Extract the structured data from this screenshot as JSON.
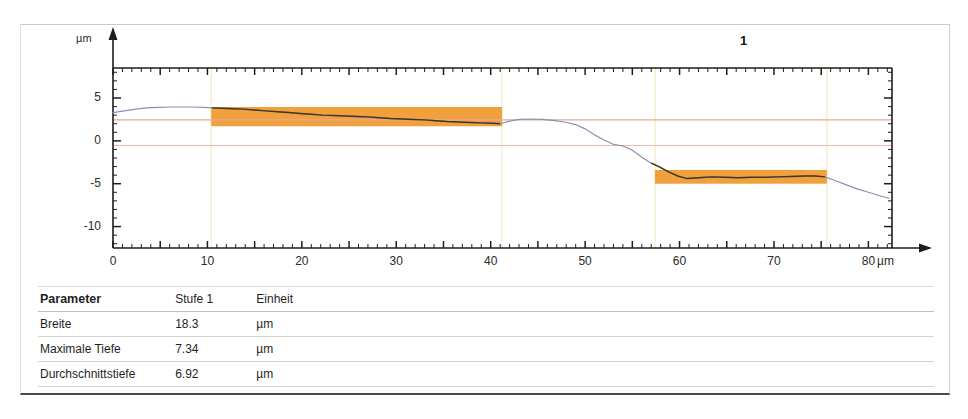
{
  "chart_data": {
    "type": "line",
    "title": "",
    "profile_label": "1",
    "xlabel": "",
    "ylabel": "",
    "x_unit": "µm",
    "y_unit": "µm",
    "xlim": [
      0,
      82.5
    ],
    "ylim": [
      -12.5,
      8.5
    ],
    "x_ticks": [
      0,
      10,
      20,
      30,
      40,
      50,
      60,
      70,
      80
    ],
    "x_tick_labels": [
      "0",
      "10",
      "20",
      "30",
      "40",
      "50",
      "60",
      "70",
      "80"
    ],
    "y_ticks": [
      5,
      0,
      -5,
      -10
    ],
    "y_tick_labels": [
      "5",
      "0",
      "-5",
      "-10"
    ],
    "grid": false,
    "legend": "none",
    "series": [
      {
        "name": "profile",
        "color": "#8a8fb5",
        "x": [
          0,
          1.2,
          2.4,
          3.6,
          4.8,
          6.0,
          7.2,
          8.4,
          9.6,
          10.5,
          11.5,
          12.6,
          13.8,
          15.0,
          16.2,
          17.4,
          18.6,
          19.8,
          21.0,
          22.2,
          23.4,
          24.6,
          25.8,
          27.0,
          28.2,
          29.4,
          30.6,
          31.8,
          33.0,
          34.2,
          35.4,
          36.6,
          37.8,
          39.0,
          40.2,
          41.0,
          42.0,
          43.0,
          44.2,
          45.4,
          46.6,
          47.8,
          49.0,
          50.0,
          51.0,
          52.0,
          53.0,
          54.0,
          55.0,
          56.0,
          57.0,
          57.8,
          58.8,
          59.8,
          60.8,
          62.0,
          63.4,
          64.8,
          66.2,
          67.6,
          69.0,
          70.4,
          71.8,
          73.2,
          74.4,
          75.4,
          76.4,
          77.6,
          78.8,
          80.0,
          81.2,
          82.2
        ],
        "y": [
          3.3,
          3.5,
          3.7,
          3.85,
          3.9,
          3.95,
          3.95,
          3.95,
          3.9,
          3.85,
          3.8,
          3.75,
          3.7,
          3.6,
          3.5,
          3.4,
          3.3,
          3.2,
          3.1,
          3.0,
          2.95,
          2.9,
          2.85,
          2.8,
          2.7,
          2.6,
          2.55,
          2.5,
          2.45,
          2.35,
          2.25,
          2.2,
          2.15,
          2.1,
          2.05,
          2.0,
          2.3,
          2.5,
          2.55,
          2.5,
          2.4,
          2.2,
          1.9,
          1.4,
          0.7,
          0.1,
          -0.4,
          -0.6,
          -1.1,
          -1.9,
          -2.6,
          -3.0,
          -3.6,
          -4.1,
          -4.4,
          -4.3,
          -4.2,
          -4.25,
          -4.3,
          -4.25,
          -4.25,
          -4.2,
          -4.15,
          -4.1,
          -4.1,
          -4.2,
          -4.6,
          -5.1,
          -5.6,
          -6.0,
          -6.4,
          -6.7
        ]
      }
    ],
    "reference_lines": [
      {
        "name": "upper-reference",
        "value": 2.45,
        "color": "#e8a79b"
      },
      {
        "name": "lower-reference",
        "value": -0.55,
        "color": "#f0b9b1"
      }
    ],
    "regions": [
      {
        "name": "upper-plateau-region",
        "x_start": 10.4,
        "x_end": 41.2,
        "y_top": 3.95,
        "y_bottom": 1.7,
        "color": "#F0A03C"
      },
      {
        "name": "lower-plateau-region",
        "x_start": 57.4,
        "x_end": 75.6,
        "y_top": -3.4,
        "y_bottom": -5.0,
        "color": "#F0A03C"
      }
    ],
    "vertical_guides": [
      {
        "x": 10.4,
        "color": "#f6eccb"
      },
      {
        "x": 41.2,
        "color": "#f6eccb"
      },
      {
        "x": 57.4,
        "color": "#f6eccb"
      },
      {
        "x": 75.6,
        "color": "#f6eccb"
      }
    ]
  },
  "table": {
    "headers": [
      "Parameter",
      "Stufe 1",
      "Einheit"
    ],
    "rows": [
      {
        "parameter": "Breite",
        "value": "18.3",
        "unit": "µm"
      },
      {
        "parameter": "Maximale Tiefe",
        "value": "7.34",
        "unit": "µm"
      },
      {
        "parameter": "Durchschnittstiefe",
        "value": "6.92",
        "unit": "µm"
      }
    ]
  }
}
